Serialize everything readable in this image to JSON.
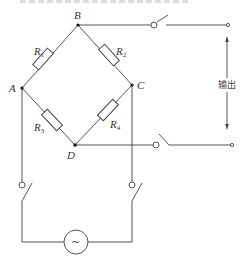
{
  "diagram": {
    "type": "wheatstone-bridge-circuit",
    "nodes": {
      "A": "A",
      "B": "B",
      "C": "C",
      "D": "D"
    },
    "resistors": [
      {
        "id": "R1",
        "label": "R",
        "sub": "1",
        "between": "A-B"
      },
      {
        "id": "R2",
        "label": "R",
        "sub": "2",
        "between": "B-C"
      },
      {
        "id": "R3",
        "label": "R",
        "sub": "3",
        "between": "A-D"
      },
      {
        "id": "R4",
        "label": "R",
        "sub": "4",
        "between": "C-D"
      }
    ],
    "output_label": "输出",
    "source_symbol": "~",
    "switches": [
      {
        "id": "sw-output-top",
        "from": "B"
      },
      {
        "id": "sw-output-bottom",
        "from": "D"
      },
      {
        "id": "sw-supply-left",
        "from": "A"
      },
      {
        "id": "sw-supply-right",
        "from": "C"
      }
    ],
    "colors": {
      "wire": "#555555",
      "background": "#ffffff",
      "node": "#111111"
    }
  }
}
